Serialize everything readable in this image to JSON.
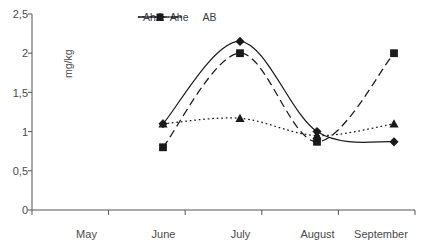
{
  "chart_data": {
    "type": "line",
    "title": "",
    "xlabel": "",
    "ylabel": "mg/kg",
    "categories": [
      "May",
      "June",
      "July",
      "August",
      "September"
    ],
    "ylim": [
      0,
      2.5
    ],
    "ytick_labels": [
      "0",
      "0,5",
      "1",
      "1,5",
      "2",
      "2,5"
    ],
    "ytick_values": [
      0,
      0.5,
      1,
      1.5,
      2,
      2.5
    ],
    "grid": false,
    "legend_position": "top-center",
    "series": [
      {
        "name": "Ah",
        "marker": "diamond",
        "line_style": "solid",
        "color": "#1a1a1a",
        "values": [
          null,
          1.1,
          2.15,
          1.0,
          0.87
        ]
      },
      {
        "name": "Ahe",
        "marker": "square",
        "line_style": "dashed",
        "color": "#1a1a1a",
        "values": [
          null,
          0.8,
          2.0,
          0.87,
          2.0
        ]
      },
      {
        "name": "AB",
        "marker": "triangle",
        "line_style": "dotted",
        "color": "#1a1a1a",
        "values": [
          null,
          1.1,
          1.17,
          0.95,
          1.1
        ]
      }
    ]
  },
  "axis": {
    "y_label": "mg/kg",
    "y_ticks": [
      "2,5",
      "2",
      "1,5",
      "1",
      "0,5",
      "0"
    ],
    "x_ticks": [
      "May",
      "June",
      "July",
      "August",
      "September"
    ]
  },
  "legend": {
    "items": [
      {
        "label": "Ah",
        "marker_icon": "diamond-marker-icon",
        "line_icon": "solid-line-icon"
      },
      {
        "label": "Ahe",
        "marker_icon": "square-marker-icon",
        "line_icon": "dashed-line-icon"
      },
      {
        "label": "AB",
        "marker_icon": "triangle-marker-icon",
        "line_icon": "dotted-line-icon"
      }
    ]
  }
}
